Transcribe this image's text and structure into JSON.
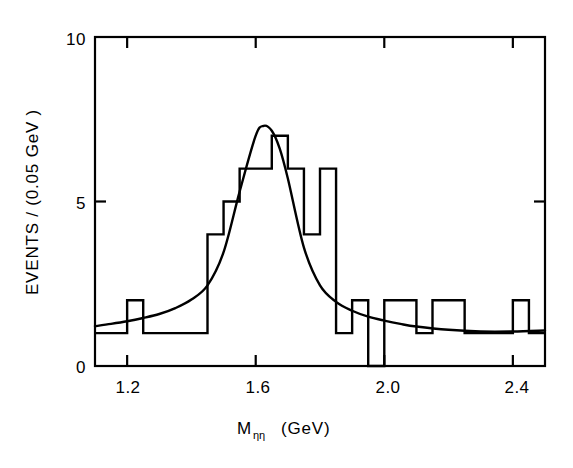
{
  "figure": {
    "name": "eta-eta invariant mass distribution",
    "background_color": "#ffffff",
    "line_color": "#000000"
  },
  "chart_data": {
    "type": "bar",
    "title": "",
    "subtitle": "",
    "xlabel": "M_ηη  (GeV)",
    "xlabel_main": "M",
    "xlabel_sub": "ηη",
    "xlabel_unit": "(GeV)",
    "ylabel": "EVENTS / (0.05 GeV )",
    "xlim": [
      1.1,
      2.5
    ],
    "ylim": [
      0,
      10
    ],
    "xticks": [
      1.2,
      1.6,
      2.0,
      2.4
    ],
    "xtick_labels": [
      "1.2",
      "1.6",
      "2.0",
      "2.4"
    ],
    "yticks": [
      0,
      5,
      10
    ],
    "ytick_labels": [
      "0",
      "5",
      "10"
    ],
    "grid": false,
    "legend": "none",
    "bin_width": 0.05,
    "bin_edges": [
      1.1,
      1.15,
      1.2,
      1.25,
      1.3,
      1.35,
      1.4,
      1.45,
      1.5,
      1.55,
      1.6,
      1.65,
      1.7,
      1.75,
      1.8,
      1.85,
      1.9,
      1.95,
      2.0,
      2.05,
      2.1,
      2.15,
      2.2,
      2.25,
      2.3,
      2.35,
      2.4,
      2.45,
      2.5
    ],
    "categories": [
      "1.10-1.15",
      "1.15-1.20",
      "1.20-1.25",
      "1.25-1.30",
      "1.30-1.35",
      "1.35-1.40",
      "1.40-1.45",
      "1.45-1.50",
      "1.50-1.55",
      "1.55-1.60",
      "1.60-1.65",
      "1.65-1.70",
      "1.70-1.75",
      "1.75-1.80",
      "1.80-1.85",
      "1.85-1.90",
      "1.90-1.95",
      "1.95-2.00",
      "2.00-2.05",
      "2.05-2.10",
      "2.10-2.15",
      "2.15-2.20",
      "2.20-2.25",
      "2.25-2.30",
      "2.30-2.35",
      "2.35-2.40",
      "2.40-2.45",
      "2.45-2.50"
    ],
    "values": [
      1,
      1,
      2,
      1,
      1,
      1,
      1,
      4,
      5,
      6,
      6,
      7,
      6,
      4,
      6,
      1,
      2,
      0,
      2,
      2,
      1,
      2,
      2,
      1,
      1,
      1,
      2,
      1
    ],
    "series": [
      {
        "name": "data histogram",
        "values": [
          1,
          1,
          2,
          1,
          1,
          1,
          1,
          4,
          5,
          6,
          6,
          7,
          6,
          4,
          6,
          1,
          2,
          0,
          2,
          2,
          1,
          2,
          2,
          1,
          1,
          1,
          2,
          1
        ]
      },
      {
        "name": "fit curve (resonance + background)",
        "description": "smooth Breit-Wigner-like peak on falling background",
        "peak_mass": 1.63,
        "peak_height": 7.3,
        "fwhm": 0.21,
        "background_left": 1.2,
        "background_right": 1.05,
        "x": [
          1.1,
          1.15,
          1.2,
          1.25,
          1.3,
          1.35,
          1.4,
          1.45,
          1.5,
          1.55,
          1.6,
          1.625,
          1.65,
          1.675,
          1.7,
          1.75,
          1.8,
          1.85,
          1.9,
          1.95,
          2.0,
          2.05,
          2.1,
          2.2,
          2.3,
          2.4,
          2.5
        ],
        "y": [
          1.21,
          1.28,
          1.36,
          1.46,
          1.58,
          1.76,
          2.02,
          2.45,
          3.46,
          5.3,
          7.0,
          7.3,
          7.15,
          6.6,
          5.7,
          3.6,
          2.45,
          1.95,
          1.68,
          1.5,
          1.38,
          1.28,
          1.2,
          1.1,
          1.05,
          1.05,
          1.08
        ]
      }
    ]
  },
  "geometry": {
    "frame_left_px": 95,
    "frame_right_px": 545,
    "frame_top_px": 37,
    "frame_bottom_px": 366
  }
}
